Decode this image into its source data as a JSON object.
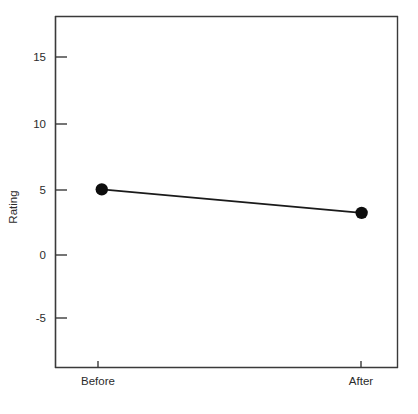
{
  "chart_data": {
    "type": "line",
    "title": "",
    "subtitle": "",
    "xlabel": "",
    "ylabel": "Rating",
    "categories": [
      "Before",
      "After"
    ],
    "x": [
      0,
      1
    ],
    "values": [
      4.9,
      3.1
    ],
    "series": [
      {
        "name": "Rating",
        "values": [
          4.9,
          3.1
        ]
      }
    ],
    "ylim": [
      -8.8,
      18.2
    ],
    "xlim": [
      -0.18,
      1.14
    ],
    "y_ticks": [
      -5,
      0,
      5,
      10,
      15
    ],
    "y_tick_labels": [
      "-5",
      "0",
      "5",
      "10",
      "15"
    ],
    "x_ticks": [
      0,
      1
    ],
    "x_tick_labels": [
      "Before",
      "After"
    ],
    "grid": false,
    "legend": false,
    "legend_position": "none",
    "annotations": [],
    "marker": "filled-circle",
    "marker_color": "#0d0d0d",
    "line_color": "#1a1a1a",
    "axis_color": "#3a3a3a",
    "background_color": "#ffffff",
    "text_color": "#2b2b2b"
  },
  "figure": {
    "width": 418,
    "height": 414,
    "plot_box": {
      "left": 55,
      "top": 16,
      "right": 398,
      "bottom": 368
    }
  }
}
